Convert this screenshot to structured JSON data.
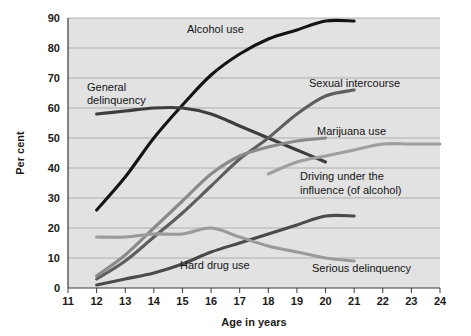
{
  "chart_data": {
    "type": "line",
    "title": "",
    "xlabel": "Age in years",
    "ylabel": "Per cent",
    "xlim": [
      11,
      24
    ],
    "ylim": [
      0,
      90
    ],
    "xticks": [
      "11",
      "12",
      "13",
      "14",
      "15",
      "16",
      "17",
      "18",
      "19",
      "20",
      "21",
      "22",
      "23",
      "24"
    ],
    "yticks": [
      "0",
      "10",
      "20",
      "30",
      "40",
      "50",
      "60",
      "70",
      "80",
      "90"
    ],
    "grid": true,
    "legend_position": "inline-annotations",
    "series": [
      {
        "name": "Alcohol use",
        "color": "#141414",
        "x": [
          12,
          13,
          14,
          15,
          16,
          17,
          18,
          19,
          20,
          21
        ],
        "values": [
          26,
          37,
          50,
          61,
          71,
          78,
          83,
          86,
          89,
          89
        ]
      },
      {
        "name": "General delinquency",
        "color": "#3d3d3d",
        "x": [
          12,
          13,
          14,
          15,
          16,
          17,
          18,
          19,
          20
        ],
        "values": [
          58,
          59,
          60,
          60,
          58,
          54,
          50,
          46,
          42
        ]
      },
      {
        "name": "Sexual intercourse",
        "color": "#5e5e5e",
        "x": [
          12,
          13,
          14,
          15,
          16,
          17,
          18,
          19,
          20,
          21
        ],
        "values": [
          3,
          9,
          17,
          25,
          34,
          43,
          50,
          58,
          64,
          66
        ]
      },
      {
        "name": "Marijuana use",
        "color": "#8a8a8a",
        "x": [
          12,
          13,
          14,
          15,
          16,
          17,
          18,
          19,
          20
        ],
        "values": [
          4,
          11,
          20,
          29,
          38,
          44,
          47,
          49,
          50
        ]
      },
      {
        "name": "Driving under the influence (of alcohol)",
        "color": "#9e9e9e",
        "x": [
          18,
          19,
          20,
          21,
          22,
          23,
          24
        ],
        "values": [
          38,
          42,
          44,
          46,
          48,
          48,
          48
        ]
      },
      {
        "name": "Hard drug use",
        "color": "#4a4a4a",
        "x": [
          12,
          13,
          14,
          15,
          16,
          17,
          18,
          19,
          20,
          21
        ],
        "values": [
          1,
          3,
          5,
          8,
          12,
          15,
          18,
          21,
          24,
          24
        ]
      },
      {
        "name": "Serious delinquency",
        "color": "#9a9a9a",
        "x": [
          12,
          13,
          14,
          15,
          16,
          17,
          18,
          19,
          20,
          21
        ],
        "values": [
          17,
          17,
          18,
          18,
          20,
          17,
          14,
          12,
          10,
          9
        ]
      }
    ],
    "annotations": [
      {
        "text": "Alcohol use",
        "x_px": 187,
        "y_px": 33,
        "anchor": "start"
      },
      {
        "text": "General",
        "x_px": 87,
        "y_px": 91,
        "anchor": "start"
      },
      {
        "text": "delinquency",
        "x_px": 87,
        "y_px": 104,
        "anchor": "start"
      },
      {
        "text": "Sexual intercourse",
        "x_px": 309,
        "y_px": 87,
        "anchor": "start"
      },
      {
        "text": "Marijuana use",
        "x_px": 317,
        "y_px": 135,
        "anchor": "start"
      },
      {
        "text": "Driving under the",
        "x_px": 300,
        "y_px": 180,
        "anchor": "start"
      },
      {
        "text": "influence (of alcohol)",
        "x_px": 300,
        "y_px": 194,
        "anchor": "start"
      },
      {
        "text": "Hard drug use",
        "x_px": 180,
        "y_px": 269,
        "anchor": "start"
      },
      {
        "text": "Serious delinquency",
        "x_px": 312,
        "y_px": 272,
        "anchor": "start"
      }
    ]
  },
  "axes": {
    "x_title": "Age in years",
    "y_title": "Per cent"
  }
}
